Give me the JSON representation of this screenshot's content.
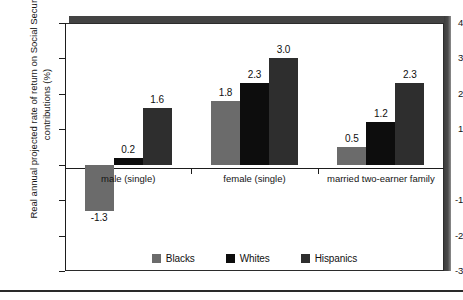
{
  "chart_data": {
    "type": "bar",
    "title": "",
    "subtitle": "",
    "xlabel": "",
    "ylabel": "Real annual projected rate of return on Social Security contributions (%)",
    "categories": [
      "male (single)",
      "female (single)",
      "married two-earner family"
    ],
    "series": [
      {
        "name": "Blacks",
        "color": "#6b6b6b",
        "values": [
          -1.3,
          1.8,
          0.5
        ]
      },
      {
        "name": "Whites",
        "color": "#0d0d0d",
        "values": [
          0.2,
          2.3,
          1.2
        ]
      },
      {
        "name": "Hispanics",
        "color": "#2e2e2e",
        "values": [
          1.6,
          3.0,
          2.3
        ]
      }
    ],
    "value_labels": [
      "-1.3",
      "0.2",
      "1.6",
      "1.8",
      "2.3",
      "3.0",
      "0.5",
      "1.2",
      "2.3"
    ],
    "ylim": [
      -3,
      4
    ],
    "yticks": [
      4,
      3,
      2,
      1,
      0,
      -1,
      -2,
      -3
    ],
    "ytick_labels": [
      "4",
      "3",
      "2",
      "1",
      "",
      "-1",
      "-2",
      "-3"
    ],
    "grid": false,
    "legend_position": "bottom-inside",
    "legend_entries": [
      "Blacks",
      "Whites",
      "Hispanics"
    ]
  },
  "axis": {
    "title": "Real annual projected rate of return on Social Security contributions (%)"
  },
  "legend": {
    "items": [
      {
        "label": "Blacks"
      },
      {
        "label": "Whites"
      },
      {
        "label": "Hispanics"
      }
    ]
  }
}
